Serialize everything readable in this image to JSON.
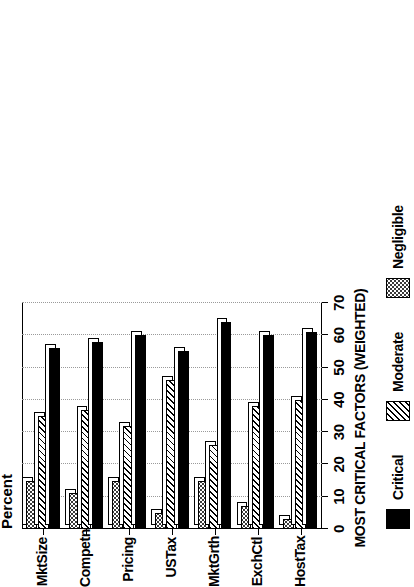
{
  "chart_data": {
    "type": "bar",
    "orientation": "horizontal-rotated",
    "title": "",
    "xlabel": "MOST CRITICAL FACTORS (WEIGHTED)",
    "ylabel": "Percent",
    "ylim": [
      0,
      70
    ],
    "ytick_step": 10,
    "yticks": [
      "0",
      "10",
      "20",
      "30",
      "40",
      "50",
      "60",
      "70"
    ],
    "grid": true,
    "legend_position": "bottom",
    "categories": [
      "HostTax",
      "ExchCtl",
      "MktGrth",
      "USTax",
      "Pricing",
      "Competn",
      "MktSize"
    ],
    "series": [
      {
        "name": "Critical",
        "color": "#000000",
        "pattern": "solid",
        "values": [
          61,
          60,
          64,
          55,
          60,
          58,
          56
        ]
      },
      {
        "name": "Moderate",
        "color": "#000000",
        "pattern": "hatch",
        "values": [
          40,
          38,
          26,
          46,
          32,
          37,
          35
        ]
      },
      {
        "name": "Negligible",
        "color": "#2b2b2b",
        "pattern": "dotted",
        "values": [
          3,
          7,
          15,
          5,
          15,
          11,
          15
        ]
      }
    ]
  },
  "axes": {
    "value_axis_title": "Percent",
    "category_axis_title": "MOST CRITICAL FACTORS (WEIGHTED)"
  },
  "legend": {
    "items": [
      {
        "label": "Critical",
        "pattern": "solid"
      },
      {
        "label": "Moderate",
        "pattern": "hatch"
      },
      {
        "label": "Negligible",
        "pattern": "dotted"
      }
    ]
  }
}
